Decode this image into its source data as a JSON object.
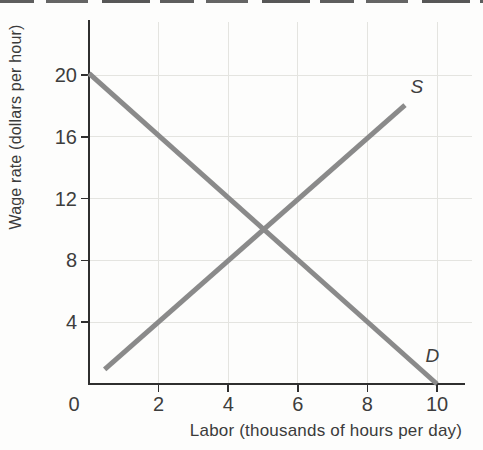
{
  "chart_data": {
    "type": "line",
    "title": "",
    "xlabel": "Labor (thousands of hours per day)",
    "ylabel": "Wage rate (dollars per hour)",
    "xlim": [
      0,
      10.8
    ],
    "ylim": [
      0,
      23.4
    ],
    "x_ticks": [
      0,
      2,
      4,
      6,
      8,
      10
    ],
    "y_ticks": [
      4,
      8,
      12,
      16,
      20
    ],
    "grid": true,
    "legend_position": "none-inline-labels",
    "series": [
      {
        "name": "supply",
        "label": "S",
        "points": [
          [
            0.45,
            0.95
          ],
          [
            9.08,
            18.05
          ]
        ],
        "label_pos": [
          9.42,
          19.2
        ],
        "color": "#8a8a8a"
      },
      {
        "name": "demand",
        "label": "D",
        "points": [
          [
            0,
            20.1
          ],
          [
            10,
            0
          ]
        ],
        "label_pos": [
          9.87,
          1.8
        ],
        "color": "#8a8a8a"
      }
    ],
    "equilibrium": {
      "x": 5,
      "y": 10
    }
  },
  "colors": {
    "curve": "#8a8a8a",
    "axis": "#2f2f2f",
    "grid": "#e4e4e0",
    "text": "#3b3b3b",
    "background": "#fdfdfc",
    "page_edge": "#424242"
  }
}
